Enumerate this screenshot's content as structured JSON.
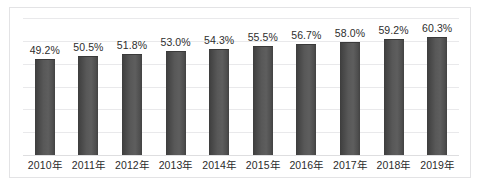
{
  "chart_data": {
    "type": "bar",
    "title": "",
    "subtitle": "",
    "xlabel": "",
    "ylabel": "",
    "categories": [
      "2010年",
      "2011年",
      "2012年",
      "2013年",
      "2014年",
      "2015年",
      "2016年",
      "2017年",
      "2018年",
      "2019年"
    ],
    "values": [
      49.2,
      50.5,
      51.8,
      53.0,
      54.3,
      55.5,
      56.7,
      58.0,
      59.2,
      60.3
    ],
    "data_labels": [
      "49.2%",
      "50.5%",
      "51.8%",
      "53.0%",
      "54.3%",
      "55.5%",
      "56.7%",
      "58.0%",
      "59.2%",
      "60.3%"
    ],
    "ylim": [
      0,
      70
    ],
    "grid": true,
    "gridline_count": 6,
    "legend": null,
    "legend_position": "none",
    "series": [
      {
        "name": "",
        "values": [
          49.2,
          50.5,
          51.8,
          53.0,
          54.3,
          55.5,
          56.7,
          58.0,
          59.2,
          60.3
        ]
      }
    ],
    "units": "%",
    "annotations": []
  },
  "style": {
    "bar_color": "#585858",
    "bar_edge_color": "#3d3d3d",
    "gridline_color": "#e9e9eb",
    "baseline_color": "#dedee0",
    "border_color": "#e3e3e5",
    "background": "#ffffff",
    "label_color": "#2e2e2e"
  }
}
